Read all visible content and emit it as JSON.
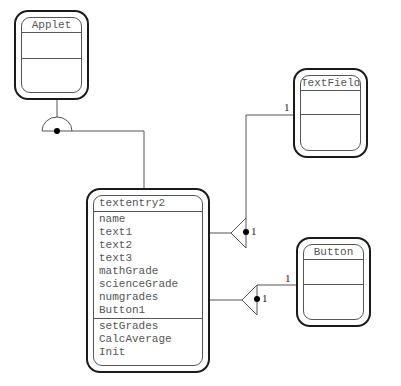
{
  "diagram": {
    "type": "UML class diagram",
    "classes": {
      "applet": {
        "name": "Applet"
      },
      "textfield": {
        "name": "TextField"
      },
      "button": {
        "name": "Button"
      },
      "main": {
        "name": "textentry2",
        "attributes": [
          "name",
          "text1",
          "text2",
          "text3",
          "mathGrade",
          "scienceGrade",
          "numgrades",
          "Button1"
        ],
        "operations": [
          "setGrades",
          "CalcAverage",
          "Init"
        ]
      }
    },
    "relationships": [
      {
        "from": "textentry2",
        "to": "Applet",
        "kind": "generalization"
      },
      {
        "from": "textentry2",
        "to": "TextField",
        "kind": "aggregation",
        "source_multiplicity": "1",
        "target_multiplicity": "1"
      },
      {
        "from": "textentry2",
        "to": "Button",
        "kind": "aggregation",
        "source_multiplicity": "1",
        "target_multiplicity": "1"
      }
    ],
    "labels": {
      "textfield_end": "1",
      "textfield_agg": "1",
      "button_end": "1",
      "button_agg": "1"
    }
  }
}
